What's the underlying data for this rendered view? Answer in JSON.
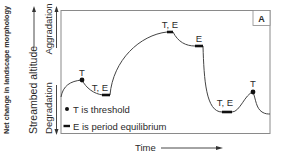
{
  "diagram": {
    "panel_label": "A",
    "y_axis": {
      "title": "Net change in landscape morphology",
      "label": "Streambed altitude",
      "up_label": "Aggradation",
      "down_label": "Degradation"
    },
    "x_axis": {
      "label": "Time"
    },
    "legend": [
      {
        "symbol": "dot",
        "text": "T is threshold"
      },
      {
        "symbol": "bar",
        "text": "E is period equilibrium"
      }
    ],
    "point_labels": [
      {
        "text": "T",
        "x": 82,
        "y": 76
      },
      {
        "text": "T, E",
        "x": 100,
        "y": 90
      },
      {
        "text": "T, E",
        "x": 170,
        "y": 28
      },
      {
        "text": "E",
        "x": 199,
        "y": 42
      },
      {
        "text": "T, E",
        "x": 226,
        "y": 106
      },
      {
        "text": "T",
        "x": 253,
        "y": 87
      }
    ],
    "colors": {
      "line": "#444444",
      "text": "#2a2a2a",
      "frame": "#8a8a8a"
    }
  }
}
